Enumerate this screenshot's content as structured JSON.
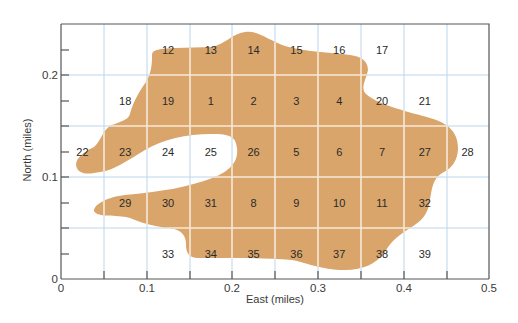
{
  "map": {
    "x_axis": {
      "title": "East (miles)",
      "range": [
        0,
        0.5
      ],
      "tick_labels": [
        "0",
        "0.1",
        "0.2",
        "0.3",
        "0.4",
        "0.5"
      ],
      "grid_step": 0.05
    },
    "y_axis": {
      "title": "North (miles)",
      "range": [
        0,
        0.25
      ],
      "tick_labels": [
        "0",
        "0.1",
        "0.2"
      ],
      "grid_step": 0.05
    },
    "colors": {
      "fill": "#d9a56a",
      "grid_on_fill": "#f6eadb",
      "grid": "#bcd6ea",
      "axis": "#555555",
      "text": "#2a2a2a"
    },
    "cells": [
      {
        "id": "12",
        "col": 2,
        "row": 4
      },
      {
        "id": "13",
        "col": 3,
        "row": 4
      },
      {
        "id": "14",
        "col": 4,
        "row": 4
      },
      {
        "id": "15",
        "col": 5,
        "row": 4
      },
      {
        "id": "16",
        "col": 6,
        "row": 4
      },
      {
        "id": "17",
        "col": 7,
        "row": 4
      },
      {
        "id": "18",
        "col": 1,
        "row": 3
      },
      {
        "id": "19",
        "col": 2,
        "row": 3
      },
      {
        "id": "1",
        "col": 3,
        "row": 3
      },
      {
        "id": "2",
        "col": 4,
        "row": 3
      },
      {
        "id": "3",
        "col": 5,
        "row": 3
      },
      {
        "id": "4",
        "col": 6,
        "row": 3
      },
      {
        "id": "20",
        "col": 7,
        "row": 3
      },
      {
        "id": "21",
        "col": 8,
        "row": 3
      },
      {
        "id": "22",
        "col": 0,
        "row": 2
      },
      {
        "id": "23",
        "col": 1,
        "row": 2
      },
      {
        "id": "24",
        "col": 2,
        "row": 2
      },
      {
        "id": "25",
        "col": 3,
        "row": 2
      },
      {
        "id": "26",
        "col": 4,
        "row": 2
      },
      {
        "id": "5",
        "col": 5,
        "row": 2
      },
      {
        "id": "6",
        "col": 6,
        "row": 2
      },
      {
        "id": "7",
        "col": 7,
        "row": 2
      },
      {
        "id": "27",
        "col": 8,
        "row": 2
      },
      {
        "id": "28",
        "col": 9,
        "row": 2
      },
      {
        "id": "29",
        "col": 1,
        "row": 1
      },
      {
        "id": "30",
        "col": 2,
        "row": 1
      },
      {
        "id": "31",
        "col": 3,
        "row": 1
      },
      {
        "id": "8",
        "col": 4,
        "row": 1
      },
      {
        "id": "9",
        "col": 5,
        "row": 1
      },
      {
        "id": "10",
        "col": 6,
        "row": 1
      },
      {
        "id": "11",
        "col": 7,
        "row": 1
      },
      {
        "id": "32",
        "col": 8,
        "row": 1
      },
      {
        "id": "33",
        "col": 2,
        "row": 0
      },
      {
        "id": "34",
        "col": 3,
        "row": 0
      },
      {
        "id": "35",
        "col": 4,
        "row": 0
      },
      {
        "id": "36",
        "col": 5,
        "row": 0
      },
      {
        "id": "37",
        "col": 6,
        "row": 0
      },
      {
        "id": "38",
        "col": 7,
        "row": 0
      },
      {
        "id": "39",
        "col": 8,
        "row": 0
      }
    ]
  }
}
